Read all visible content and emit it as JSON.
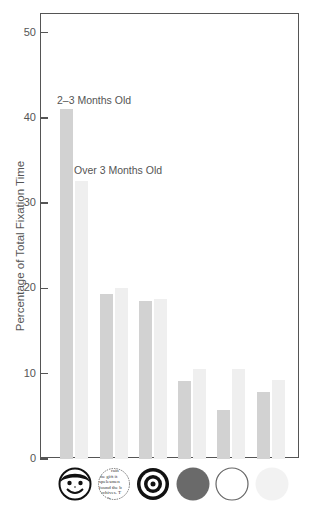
{
  "chart_data": {
    "type": "bar",
    "title": "",
    "xlabel": "",
    "ylabel": "Percentage of Total Fixation Time",
    "ylim": [
      0,
      52
    ],
    "yticks": [
      0,
      10,
      20,
      30,
      40,
      50
    ],
    "grid": false,
    "legend_position": "inline annotations above first bar pair",
    "categories": [
      "Face",
      "Newsprint",
      "Bullseye",
      "Red disc",
      "White disc",
      "Yellow disc"
    ],
    "series": [
      {
        "name": "2–3 Months Old",
        "color": "#d2d2d2",
        "values": [
          41,
          19.3,
          18.5,
          9.2,
          5.8,
          7.9
        ]
      },
      {
        "name": "Over 3 Months Old",
        "color": "#efefef",
        "values": [
          32.6,
          20.1,
          18.8,
          10.5,
          10.5,
          9.3
        ]
      }
    ],
    "annotations": [
      "2–3 Months Old",
      "Over 3 Months Old"
    ]
  },
  "axis": {
    "ylabel": "Percentage of Total Fixation Time",
    "ticks": [
      "0",
      "10",
      "20",
      "30",
      "40",
      "50"
    ]
  },
  "annotations": {
    "series0": "2–3 Months Old",
    "series1": "Over 3 Months Old"
  },
  "stimuli": [
    {
      "name": "face",
      "icon": "face-icon"
    },
    {
      "name": "newsprint",
      "icon": "newsprint-icon",
      "text_lines": [
        "rain",
        "the gift it",
        "spelesmen",
        "found the b",
        "archives. T",
        "ng. th"
      ]
    },
    {
      "name": "bullseye",
      "icon": "bullseye-icon"
    },
    {
      "name": "red disc",
      "icon": "red-disc-icon",
      "color": "#6a6a6a"
    },
    {
      "name": "white disc",
      "icon": "white-disc-icon",
      "color": "#ffffff"
    },
    {
      "name": "yellow disc",
      "icon": "yellow-disc-icon",
      "color": "#f2f2f2"
    }
  ]
}
